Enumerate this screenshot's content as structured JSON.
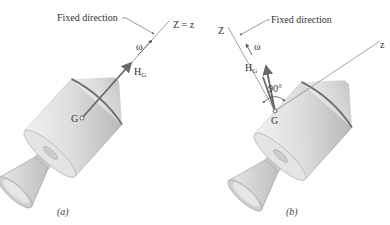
{
  "diagram": {
    "panel_a": {
      "caption": "(a)",
      "fixed_direction_label": "Fixed direction",
      "axis_label": "Z = z",
      "omega_label": "ω",
      "momentum_label": "H",
      "momentum_subscript": "G",
      "center_label": "G"
    },
    "panel_b": {
      "caption": "(b)",
      "fixed_direction_label": "Fixed direction",
      "fixed_axis_label": "Z",
      "body_axis_label": "z",
      "omega_label": "ω",
      "momentum_label": "H",
      "momentum_subscript": "G",
      "center_label": "G",
      "angle_label": "90°"
    },
    "colors": {
      "body_fill": "#d9d9d9",
      "body_shade": "#bdbdbd",
      "band": "#6e6e6e",
      "vector": "#6a6a6a",
      "axis_line": "#8a8a8a"
    }
  }
}
